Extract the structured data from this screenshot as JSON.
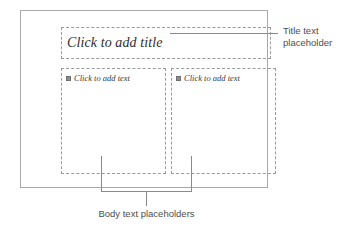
{
  "slide": {
    "title_placeholder": {
      "prompt": "Click to add title"
    },
    "body_placeholders": [
      {
        "bullet_icon": "filled-square-bullet",
        "prompt": "Click to add text"
      },
      {
        "bullet_icon": "filled-square-bullet",
        "prompt": "Click to add text"
      }
    ]
  },
  "callouts": {
    "title": {
      "line1": "Title text",
      "line2": "placeholder"
    },
    "body": {
      "label": "Body text placeholders"
    }
  },
  "colors": {
    "slide_border": "#a8a8a8",
    "placeholder_border": "#9a9a9a",
    "leader_line": "#8a8a8a",
    "callout_text": "#4d4d4d",
    "prompt_text": "#2e2e2e",
    "bullet": "#8c8c8c"
  }
}
